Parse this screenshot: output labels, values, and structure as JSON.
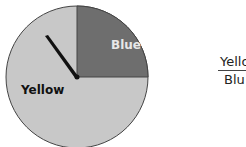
{
  "spinner": {
    "sections": [
      {
        "label": "Blue",
        "fraction": "1/4",
        "color": "#6e6e6e",
        "label_color": "#e8e8e8"
      },
      {
        "label": "Yellow",
        "fraction": "3/4",
        "color": "#c8c8c8",
        "label_color": "#111111"
      }
    ],
    "pointer_angle_deg": -35
  },
  "fraction": {
    "numerator": "Yello",
    "denominator": "Blu"
  }
}
